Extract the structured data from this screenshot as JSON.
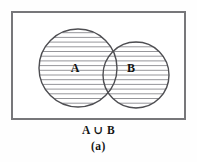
{
  "figure": {
    "kind": "venn-diagram",
    "width": 197,
    "height": 162,
    "background_color": "#fefefe"
  },
  "universe_rect": {
    "name": "universal-set-rectangle",
    "x": 11,
    "y": 11,
    "width": 175,
    "height": 109,
    "stroke_color": "#77777a",
    "stroke_width": 2,
    "fill_color": "#ffffff"
  },
  "sets": [
    {
      "id": "A",
      "label": "A",
      "label_x": 75,
      "label_y": 72,
      "cx": 78,
      "cy": 68,
      "r": 39,
      "stroke_color": "#4e4e52",
      "stroke_width": 1.4,
      "shaded": true
    },
    {
      "id": "B",
      "label": "B",
      "label_x": 131,
      "label_y": 72,
      "cx": 136,
      "cy": 75,
      "r": 33,
      "stroke_color": "#4e4e52",
      "stroke_width": 1.4,
      "shaded": true
    }
  ],
  "shading": {
    "style": "horizontal-hatch",
    "description": "union of A and B filled with horizontal rule lines",
    "line_color": "#8a8a8e",
    "line_width": 0.9,
    "spacing_px": 4.7,
    "first_line_y": 28,
    "line_count": 18
  },
  "caption": {
    "expression": "A ∪ B",
    "figure_label": "(a)",
    "text_color": "#141414"
  },
  "accent_colors": {
    "rect_border": "#77777a",
    "circle_stroke": "#4e4e52",
    "hatch": "#8a8a8e",
    "text": "#141414"
  }
}
